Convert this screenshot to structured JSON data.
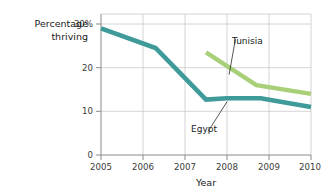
{
  "chart_data": {
    "type": "line",
    "title": "",
    "xlabel": "Year",
    "ylabel": "Percentage thriving",
    "ylabel_line1": "Percentage",
    "ylabel_line2": "thriving",
    "xlim": [
      2005,
      2010
    ],
    "ylim": [
      0,
      30
    ],
    "grid": true,
    "legend_position": "inline-annotations",
    "y_ticks": [
      {
        "value": 30,
        "label": "30%"
      },
      {
        "value": 20,
        "label": "20"
      },
      {
        "value": 10,
        "label": "10"
      },
      {
        "value": 0,
        "label": "0"
      }
    ],
    "x_ticks": [
      {
        "value": 2005,
        "label": "2005"
      },
      {
        "value": 2006,
        "label": "2006"
      },
      {
        "value": 2007,
        "label": "2007"
      },
      {
        "value": 2008,
        "label": "2008"
      },
      {
        "value": 2009,
        "label": "2009"
      },
      {
        "value": 2010,
        "label": "2010"
      }
    ],
    "series": [
      {
        "name": "Egypt",
        "color": "#3f9a9a",
        "x": [
          2005,
          2006.3,
          2007.5,
          2008.0,
          2008.8,
          2010
        ],
        "values": [
          29,
          24.5,
          12.7,
          13,
          13,
          11
        ]
      },
      {
        "name": "Tunisia",
        "color": "#a9cf79",
        "x": [
          2007.5,
          2008.7,
          2010
        ],
        "values": [
          23.5,
          16,
          14
        ]
      }
    ],
    "annotations": [
      {
        "name": "Tunisia",
        "label_x": 2008.2,
        "label_y": 26.5,
        "point_x": 2008.05,
        "point_y": 18.4
      },
      {
        "name": "Egypt",
        "label_x": 2007.55,
        "label_y": 5.4,
        "point_x": 2008.0,
        "point_y": 12.2
      }
    ]
  }
}
